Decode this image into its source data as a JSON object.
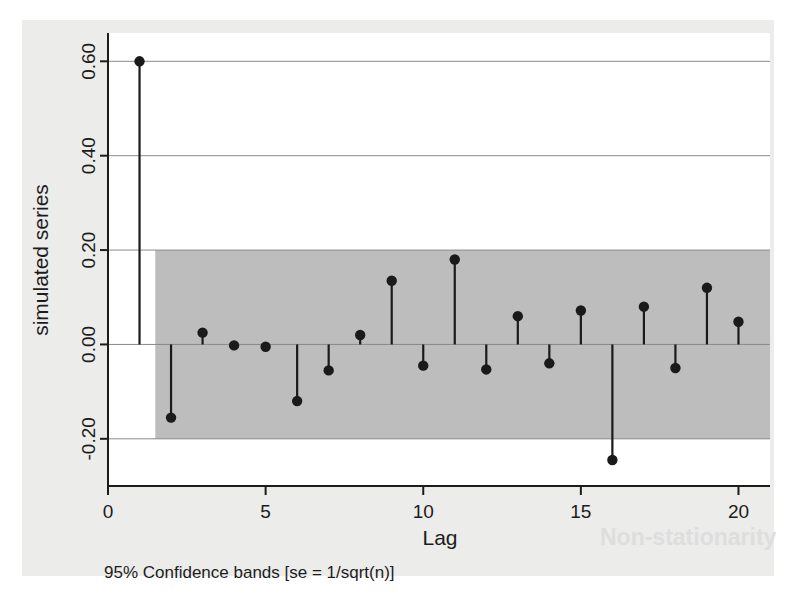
{
  "figure": {
    "kind": "correlogram",
    "note": "95% Confidence bands [se = 1/sqrt(n)]"
  },
  "chart_data": {
    "type": "bar",
    "title": "",
    "subtitle": "",
    "xlabel": "Lag",
    "ylabel": "simulated series",
    "categories": [
      1,
      2,
      3,
      4,
      5,
      6,
      7,
      8,
      9,
      10,
      11,
      12,
      13,
      14,
      15,
      16,
      17,
      18,
      19,
      20
    ],
    "values": [
      0.6,
      -0.155,
      0.025,
      -0.002,
      -0.005,
      -0.12,
      -0.055,
      0.02,
      0.135,
      -0.045,
      0.18,
      -0.053,
      0.06,
      -0.04,
      0.072,
      -0.245,
      0.08,
      -0.05,
      0.12,
      0.048
    ],
    "xlim": [
      0,
      21
    ],
    "ylim": [
      -0.3,
      0.66
    ],
    "xticks": [
      0,
      5,
      10,
      15,
      20
    ],
    "xtick_labels": [
      "0",
      "5",
      "10",
      "15",
      "20"
    ],
    "yticks": [
      -0.2,
      0.0,
      0.2,
      0.4,
      0.6
    ],
    "ytick_labels": [
      "-0.20",
      "0.00",
      "0.20",
      "0.40",
      "0.60"
    ],
    "grid": true,
    "grid_axis": "y",
    "legend": "none",
    "marker": "circle",
    "marker_color": "#1a1a1a",
    "stem_color": "#1a1a1a",
    "band": {
      "label": "95% confidence band",
      "upper": 0.2,
      "lower": -0.2,
      "color": "#bdbdbd"
    }
  },
  "axis": {
    "y_title": "simulated series",
    "x_title": "Lag",
    "y_tick_0": "0.60",
    "y_tick_1": "0.40",
    "y_tick_2": "0.20",
    "y_tick_3": "0.00",
    "y_tick_4": "-0.20",
    "x_tick_0": "0",
    "x_tick_1": "5",
    "x_tick_2": "10",
    "x_tick_3": "15",
    "x_tick_4": "20"
  },
  "ghost": {
    "bleed_text": "Non-stationarity"
  }
}
